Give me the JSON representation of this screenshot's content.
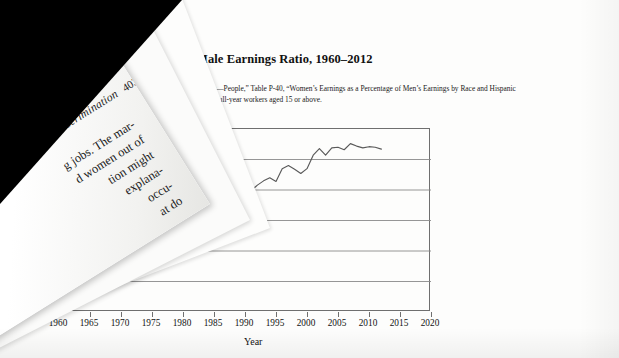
{
  "scene": {
    "kind": "photo-of-book-page",
    "description": "Photograph of an open textbook page with a page being turned over the left side",
    "background_color": "#fdfdfc",
    "shadow_color": "#000000"
  },
  "turning_page": {
    "running_head": "ket Discrimination",
    "folio": "403",
    "body_lines": [
      "g jobs. The mar-",
      "d women out of",
      "tion might",
      "explana-",
      "occu-",
      "at do",
      "ists"
    ]
  },
  "figure": {
    "title": "Male Earnings Ratio, 1960–2012",
    "source_line_1": "Tables—People,” Table P-40, “Women’s Earnings as a Percentage of Men’s Earnings by Race and Hispanic",
    "source_line_2": "-time, full-year workers aged 15 or above."
  },
  "chart_data": {
    "type": "line",
    "title": "Male Earnings Ratio, 1960–2012",
    "xlabel": "Year",
    "ylabel": "Female–t",
    "xlim": [
      1960,
      2020
    ],
    "ylim": [
      0.5,
      0.8
    ],
    "grid": true,
    "legend": "none",
    "xticks": [
      1960,
      1965,
      1970,
      1975,
      1980,
      1985,
      1990,
      1995,
      2000,
      2005,
      2010,
      2015,
      2020
    ],
    "yticks_visible": [
      0.6,
      0.55,
      0.5
    ],
    "gridline_values": [
      0.55,
      0.6,
      0.65,
      0.7,
      0.75,
      0.8
    ],
    "line_color": "#5a5a5a",
    "x": [
      1960,
      1961,
      1962,
      1963,
      1964,
      1965,
      1966,
      1967,
      1968,
      1969,
      1970,
      1971,
      1972,
      1973,
      1974,
      1975,
      1976,
      1977,
      1978,
      1979,
      1980,
      1981,
      1982,
      1983,
      1984,
      1985,
      1986,
      1987,
      1988,
      1989,
      1990,
      1991,
      1992,
      1993,
      1994,
      1995,
      1996,
      1997,
      1998,
      1999,
      2000,
      2001,
      2002,
      2003,
      2004,
      2005,
      2006,
      2007,
      2008,
      2009,
      2010,
      2011,
      2012
    ],
    "y": [
      0.607,
      0.593,
      0.594,
      0.596,
      0.594,
      0.6,
      0.576,
      0.578,
      0.582,
      0.585,
      0.594,
      0.595,
      0.579,
      0.568,
      0.586,
      0.589,
      0.6,
      0.589,
      0.597,
      0.598,
      0.602,
      0.592,
      0.617,
      0.637,
      0.637,
      0.646,
      0.644,
      0.651,
      0.662,
      0.687,
      0.716,
      0.699,
      0.708,
      0.715,
      0.72,
      0.714,
      0.735,
      0.74,
      0.734,
      0.727,
      0.735,
      0.757,
      0.768,
      0.757,
      0.769,
      0.77,
      0.766,
      0.776,
      0.772,
      0.769,
      0.771,
      0.77,
      0.767
    ]
  }
}
